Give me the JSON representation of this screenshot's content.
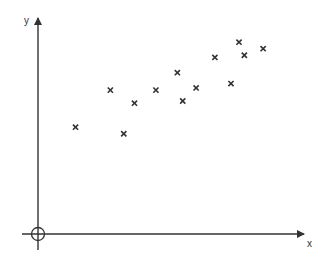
{
  "chart_data": {
    "type": "scatter",
    "title": "",
    "xlabel": "x",
    "ylabel": "y",
    "grid": false,
    "legend": null,
    "marker": "x",
    "origin_marker": "circle-crosshair",
    "xlim": [
      0,
      100
    ],
    "ylim": [
      0,
      100
    ],
    "points": [
      {
        "x": 14,
        "y": 49
      },
      {
        "x": 27,
        "y": 66
      },
      {
        "x": 32,
        "y": 46
      },
      {
        "x": 36,
        "y": 60
      },
      {
        "x": 44,
        "y": 66
      },
      {
        "x": 52,
        "y": 74
      },
      {
        "x": 54,
        "y": 61
      },
      {
        "x": 59,
        "y": 67
      },
      {
        "x": 66,
        "y": 81
      },
      {
        "x": 72,
        "y": 69
      },
      {
        "x": 75,
        "y": 88
      },
      {
        "x": 77,
        "y": 82
      },
      {
        "x": 84,
        "y": 85
      }
    ],
    "colors": {
      "axis": "#333333",
      "marker": "#333333"
    }
  },
  "axes": {
    "x_label": "x",
    "y_label": "y"
  }
}
